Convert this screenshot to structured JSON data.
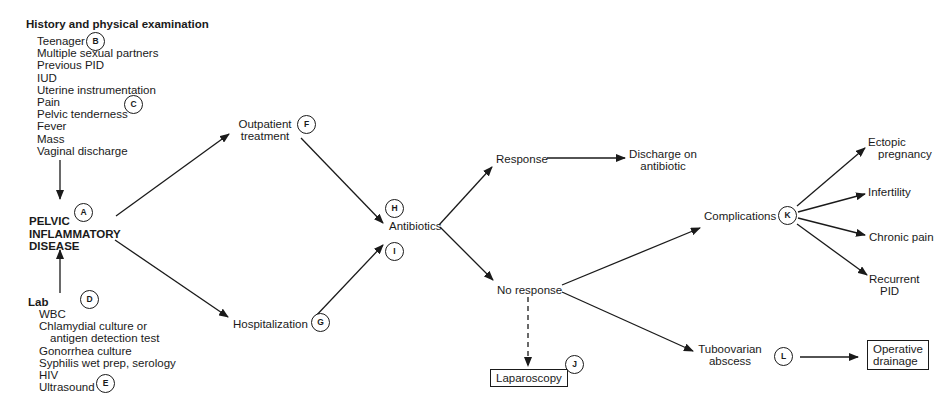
{
  "history": {
    "heading": "History and physical examination",
    "items": [
      "Teenager",
      "Multiple sexual partners",
      "Previous PID",
      "IUD",
      "Uterine instrumentation",
      "Pain",
      "Pelvic tenderness",
      "Fever",
      "Mass",
      "Vaginal discharge"
    ]
  },
  "pid": {
    "line1": "PELVIC",
    "line2": "INFLAMMATORY",
    "line3": "DISEASE"
  },
  "lab": {
    "heading": "Lab",
    "items": [
      "WBC",
      "Chlamydial culture or",
      "antigen detection test",
      "Gonorrhea culture",
      "Syphilis wet prep, serology",
      "HIV",
      "Ultrasound"
    ]
  },
  "nodes": {
    "outpatient": {
      "line1": "Outpatient",
      "line2": "treatment"
    },
    "hospitalization": "Hospitalization",
    "antibiotics": "Antibiotics",
    "response": "Response",
    "discharge": {
      "line1": "Discharge on",
      "line2": "antibiotic"
    },
    "no_response": "No response",
    "laparoscopy": "Laparoscopy",
    "complications": "Complications",
    "tuboovarian": {
      "line1": "Tuboovarian",
      "line2": "abscess"
    },
    "operative": {
      "line1": "Operative",
      "line2": "drainage"
    },
    "ectopic": {
      "line1": "Ectopic",
      "line2": "pregnancy"
    },
    "infertility": "Infertility",
    "chronic_pain": "Chronic pain",
    "recurrent": {
      "line1": "Recurrent",
      "line2": "PID"
    }
  },
  "markers": {
    "A": "A",
    "B": "B",
    "C": "C",
    "D": "D",
    "E": "E",
    "F": "F",
    "G": "G",
    "H": "H",
    "I": "I",
    "J": "J",
    "K": "K",
    "L": "L"
  }
}
